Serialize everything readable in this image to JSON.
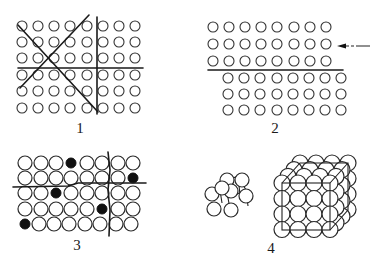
{
  "figure": {
    "colors": {
      "ink": "#1a1a1a",
      "background": "#ffffff",
      "impurity": "#111111"
    },
    "panels": [
      {
        "id": 1,
        "label": "1",
        "description": "Square lattice of atoms cut by slip planes (two diagonals, one vertical, one horizontal)",
        "grid": {
          "cols": [
            22,
            38,
            54,
            70,
            87,
            103,
            119,
            135
          ],
          "rows": [
            26,
            42,
            58,
            75,
            91,
            108
          ],
          "radius": 5
        },
        "lines": [
          {
            "x1": 18,
            "y1": 25,
            "x2": 98,
            "y2": 112
          },
          {
            "x1": 20,
            "y1": 88,
            "x2": 89,
            "y2": 15
          },
          {
            "x1": 97,
            "y1": 17,
            "x2": 97,
            "y2": 114
          },
          {
            "x1": 18,
            "y1": 68,
            "x2": 143,
            "y2": 68
          }
        ],
        "label_pos": {
          "x": 80,
          "y": 133
        }
      },
      {
        "id": 2,
        "label": "2",
        "description": "Crystal lattice with shear along a slip plane; upper rows displaced relative to lower rows; arrow indicates applied force",
        "upper": {
          "cols": [
            213,
            229,
            245,
            261,
            277,
            294,
            310,
            326
          ],
          "rows": [
            27,
            44,
            61
          ]
        },
        "lower": {
          "cols": [
            228,
            244,
            260,
            277,
            293,
            309,
            325,
            341
          ],
          "rows": [
            78,
            94,
            110
          ]
        },
        "radius": 5,
        "slip_line": {
          "x1": 208,
          "y1": 70,
          "x2": 343,
          "y2": 70
        },
        "arrow": {
          "x1": 370,
          "y1": 46,
          "x2": 337,
          "y2": 46,
          "direction": "left"
        },
        "label_pos": {
          "x": 275,
          "y": 133
        }
      },
      {
        "id": 3,
        "label": "3",
        "description": "Lattice with impurity atoms (filled black) and grain boundary lines",
        "grid": {
          "cols": [
            25,
            41,
            56,
            71,
            87,
            102,
            118,
            133
          ],
          "rows": [
            163,
            178,
            193,
            209,
            224
          ],
          "radius": 7
        },
        "impurities": [
          {
            "row": 0,
            "col": 3
          },
          {
            "row": 1,
            "col": 7
          },
          {
            "row": 2,
            "col": 2
          },
          {
            "row": 3,
            "col": 5
          },
          {
            "row": 4,
            "col": 0
          }
        ],
        "lines": [
          {
            "d": "M13 187 L68 186 L78 183 L146 183"
          },
          {
            "d": "M108 152 L110 170 L108 190 L110 210 L109 236"
          }
        ],
        "label_pos": {
          "x": 77,
          "y": 250
        }
      },
      {
        "id": 4,
        "label": "4",
        "description": "Face-centered cubic unit cell (small) and extended cubic crystal block (large) with close-packed spheres",
        "small_cluster": {
          "radius": 7,
          "circles": [
            [
              227,
              180
            ],
            [
              242,
              180
            ],
            [
              212,
              194
            ],
            [
              231,
              191
            ],
            [
              246,
              196
            ],
            [
              222,
              188
            ],
            [
              214,
              209
            ],
            [
              231,
              210
            ]
          ]
        },
        "large_cube": {
          "front_face": {
            "x": 282,
            "y": 183,
            "w": 48,
            "h": 47
          },
          "back_face": {
            "x": 300,
            "y": 163,
            "w": 48,
            "h": 47
          },
          "radius": 8
        },
        "label_pos": {
          "x": 271,
          "y": 253
        }
      }
    ]
  }
}
